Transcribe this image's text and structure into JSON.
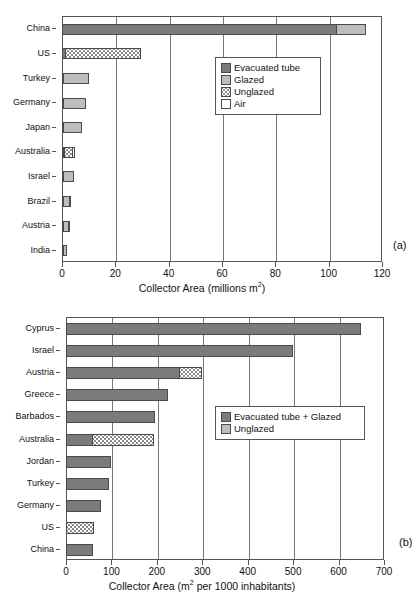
{
  "figure": {
    "panels": [
      {
        "tag": "(a)",
        "xlabel_prefix": "Collector Area (millions m",
        "xlabel_sup": "2",
        "xlabel_suffix": ")"
      },
      {
        "tag": "(b)",
        "xlabel_prefix": "Collector Area (m",
        "xlabel_sup": "2",
        "xlabel_suffix": " per 1000 inhabitants)"
      }
    ]
  },
  "colors": {
    "evacuated_tube": "#7b7b7b",
    "glazed": "#bdbdbd",
    "unglazed": "#ffffff",
    "air": "#ffffff",
    "axis": "#555555",
    "grid": "#777777"
  },
  "chart_data": [
    {
      "type": "bar",
      "orientation": "horizontal",
      "stacked": true,
      "panel": "(a)",
      "title": "",
      "xlabel": "Collector Area (millions m2)",
      "ylabel": "",
      "xlim": [
        0,
        120
      ],
      "xticks": [
        0,
        20,
        40,
        60,
        80,
        100,
        120
      ],
      "grid": "vertical",
      "legend_position": "upper-right-inside",
      "categories": [
        "China",
        "US",
        "Turkey",
        "Germany",
        "Japan",
        "Australia",
        "Israel",
        "Brazil",
        "Austria",
        "India"
      ],
      "series": [
        {
          "name": "Evacuated tube",
          "values": [
            103.0,
            1.5,
            0.6,
            0.8,
            0.2,
            0.2,
            0.3,
            0.2,
            0.3,
            0.2
          ]
        },
        {
          "name": "Glazed",
          "values": [
            11.5,
            0.0,
            9.9,
            8.7,
            7.3,
            0.9,
            4.3,
            2.6,
            2.3,
            1.5
          ]
        },
        {
          "name": "Unglazed",
          "values": [
            0.0,
            28.5,
            0.0,
            0.0,
            0.0,
            3.3,
            0.0,
            0.0,
            0.0,
            0.0
          ]
        },
        {
          "name": "Air",
          "values": [
            0.0,
            0.0,
            0.0,
            0.0,
            0.0,
            1.2,
            0.0,
            0.4,
            0.5,
            0.0
          ]
        }
      ],
      "totals": [
        114.5,
        30.0,
        10.5,
        9.5,
        7.5,
        5.6,
        4.6,
        3.2,
        3.1,
        1.7
      ],
      "legend": [
        {
          "label": "Evacuated tube",
          "swatch": "evac"
        },
        {
          "label": "Glazed",
          "swatch": "glazed"
        },
        {
          "label": "Unglazed",
          "swatch": "unglazed"
        },
        {
          "label": "Air",
          "swatch": "air"
        }
      ]
    },
    {
      "type": "bar",
      "orientation": "horizontal",
      "stacked": true,
      "panel": "(b)",
      "title": "",
      "xlabel": "Collector Area (m2 per 1000 inhabitants)",
      "ylabel": "",
      "xlim": [
        0,
        700
      ],
      "xticks": [
        0,
        100,
        200,
        300,
        400,
        500,
        600,
        700
      ],
      "grid": "vertical",
      "legend_position": "middle-right-inside",
      "categories": [
        "Cyprus",
        "Israel",
        "Austria",
        "Greece",
        "Barbados",
        "Australia",
        "Jordan",
        "Turkey",
        "Germany",
        "US",
        "China"
      ],
      "series": [
        {
          "name": "Evacuated tube + Glazed",
          "values": [
            650,
            500,
            250,
            225,
            197,
            60,
            100,
            95,
            78,
            0,
            60
          ]
        },
        {
          "name": "Unglazed",
          "values": [
            0,
            0,
            52,
            0,
            0,
            135,
            0,
            0,
            0,
            62,
            0
          ]
        }
      ],
      "totals": [
        650,
        500,
        302,
        225,
        197,
        195,
        100,
        95,
        78,
        62,
        60
      ],
      "legend": [
        {
          "label": "Evacuated tube + Glazed",
          "swatch": "evac"
        },
        {
          "label": "Unglazed",
          "swatch": "glazed"
        }
      ]
    }
  ]
}
